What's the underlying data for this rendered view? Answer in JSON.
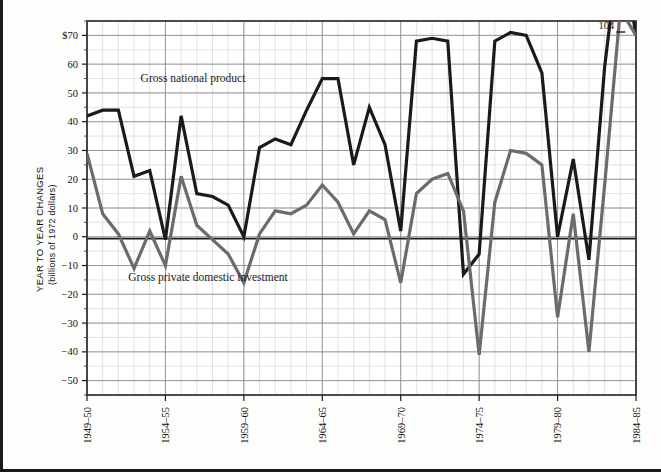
{
  "chart_data": {
    "type": "line",
    "title": "",
    "ylabel": "YEAR TO YEAR CHANGES",
    "ylabel_sub": "(billions of 1972 dollars)",
    "xlabel": "",
    "ylim": [
      -55,
      75
    ],
    "yticks": [
      70,
      60,
      50,
      40,
      30,
      20,
      10,
      0,
      -10,
      -20,
      -30,
      -40,
      -50
    ],
    "ytick_labels": [
      "$70",
      "60",
      "50",
      "40",
      "30",
      "20",
      "10",
      "0",
      "−10",
      "−20",
      "−30",
      "−40",
      "−50"
    ],
    "grid": true,
    "grid_minor": true,
    "legend_position": "inline-annotation",
    "x": [
      "1949-50",
      "1950-51",
      "1951-52",
      "1952-53",
      "1953-54",
      "1954-55",
      "1955-56",
      "1956-57",
      "1957-58",
      "1958-59",
      "1959-60",
      "1960-61",
      "1961-62",
      "1962-63",
      "1963-64",
      "1964-65",
      "1965-66",
      "1966-67",
      "1967-68",
      "1968-69",
      "1969-70",
      "1970-71",
      "1971-72",
      "1972-73",
      "1973-74",
      "1974-75",
      "1975-76",
      "1976-77",
      "1977-78",
      "1978-79",
      "1979-80",
      "1980-81",
      "1981-82",
      "1982-83",
      "1983-84",
      "1984-85"
    ],
    "xtick_labels": [
      "1949–50",
      "1954–55",
      "1959–60",
      "1964–65",
      "1969–70",
      "1974–75",
      "1979–80",
      "1984–85"
    ],
    "xtick_indices": [
      0,
      5,
      10,
      15,
      20,
      25,
      30,
      35
    ],
    "series": [
      {
        "name": "Gross national product",
        "color": "#1a1a1a",
        "width": 3.2,
        "label_x_index": 8,
        "values": [
          42,
          44,
          44,
          21,
          23,
          -1,
          42,
          15,
          14,
          11,
          0,
          31,
          34,
          32,
          44,
          55,
          55,
          25,
          45,
          32,
          2,
          68,
          69,
          68,
          -13,
          -6,
          68,
          71,
          70,
          57,
          0,
          27,
          -8,
          59,
          104,
          70
        ]
      },
      {
        "name": "Gross private domestic investment",
        "color": "#6b6b6b",
        "width": 3.2,
        "label_x_index": 10,
        "values": [
          29,
          8,
          1,
          -11,
          2,
          -10,
          21,
          4,
          -1,
          -6,
          -16,
          1,
          9,
          8,
          11,
          18,
          12,
          1,
          9,
          6,
          -16,
          15,
          20,
          22,
          9,
          -41,
          12,
          30,
          29,
          25,
          -28,
          8,
          -40,
          18,
          79,
          70
        ]
      }
    ],
    "annotations": [
      {
        "text": "104",
        "x_index": 34,
        "y": 104,
        "note": "off-scale peak value"
      }
    ],
    "series_labels": [
      {
        "text": "Gross national product",
        "x": 190,
        "y": 82
      },
      {
        "text": "Gross private domestic investment",
        "x": 205,
        "y": 281
      }
    ]
  },
  "axis": {
    "y_title_line1": "YEAR TO YEAR CHANGES",
    "y_title_line2": "(billions of 1972 dollars)"
  }
}
